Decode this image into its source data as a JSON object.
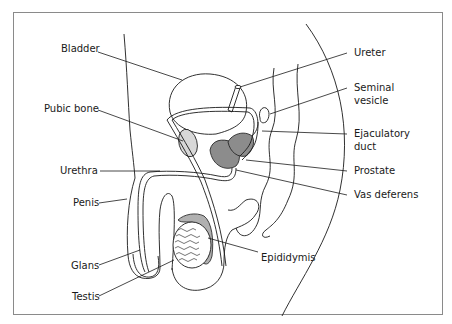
{
  "diagram": {
    "labels_left": [
      {
        "id": "bladder",
        "text": "Bladder"
      },
      {
        "id": "pubic-bone",
        "text": "Pubic bone"
      },
      {
        "id": "urethra",
        "text": "Urethra"
      },
      {
        "id": "penis",
        "text": "Penis"
      },
      {
        "id": "glans",
        "text": "Glans"
      },
      {
        "id": "testis",
        "text": "Testis"
      }
    ],
    "labels_right": [
      {
        "id": "ureter",
        "text": "Ureter"
      },
      {
        "id": "seminal-vesicle",
        "text": "Seminal",
        "text2": "vesicle"
      },
      {
        "id": "ejaculatory-duct",
        "text": "Ejaculatory",
        "text2": "duct"
      },
      {
        "id": "prostate",
        "text": "Prostate"
      },
      {
        "id": "vas-deferens",
        "text": "Vas deferens"
      }
    ],
    "labels_bottom": [
      {
        "id": "epididymis",
        "text": "Epididymis"
      }
    ],
    "colors": {
      "frame": "#8a8a8a",
      "line": "#1a1a1a",
      "pubic_bone_fill": "#d8d8d8",
      "prostate_fill": "#8c8c8c",
      "epididymis_fill": "#b0b0b0"
    }
  }
}
